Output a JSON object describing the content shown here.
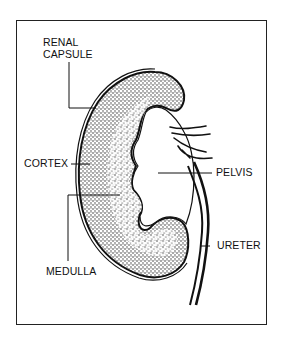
{
  "figure": {
    "labels": {
      "renal_capsule_line1": "RENAL",
      "renal_capsule_line2": "CAPSULE",
      "cortex": "CORTEX",
      "pelvis": "PELVIS",
      "ureter": "URETER",
      "medulla": "MEDULLA"
    }
  },
  "colors": {
    "ink": "#111111",
    "background": "#ffffff"
  }
}
